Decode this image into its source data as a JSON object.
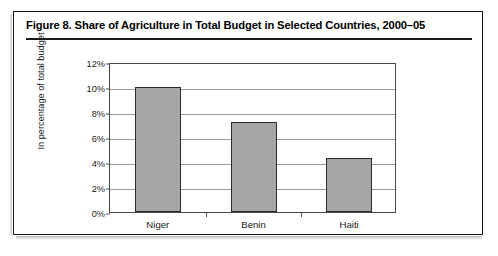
{
  "figure": {
    "title": "Figure 8.  Share of Agriculture in Total Budget in Selected Countries, 2000–05"
  },
  "chart_data": {
    "type": "bar",
    "title": "Figure 8.  Share of Agriculture in Total Budget in Selected Countries, 2000–05",
    "categories": [
      "Niger",
      "Benin",
      "Haiti"
    ],
    "values": [
      10.0,
      7.2,
      4.3
    ],
    "value_unit": "percent",
    "xlabel": "",
    "ylabel": "In percentage of total budget",
    "ylim": [
      0,
      12
    ],
    "ytick_step": 2,
    "ytick_labels": [
      "0%",
      "2%",
      "4%",
      "6%",
      "8%",
      "10%",
      "12%"
    ],
    "ytick_values": [
      0,
      2,
      4,
      6,
      8,
      10,
      12
    ],
    "grid": "horizontal",
    "legend": "none",
    "bar_fill_color": "#a6a6a6",
    "bar_border_color": "#2b2b2b",
    "gridline_color": "#9a9a9a",
    "axis_color": "#4a4a4a"
  }
}
